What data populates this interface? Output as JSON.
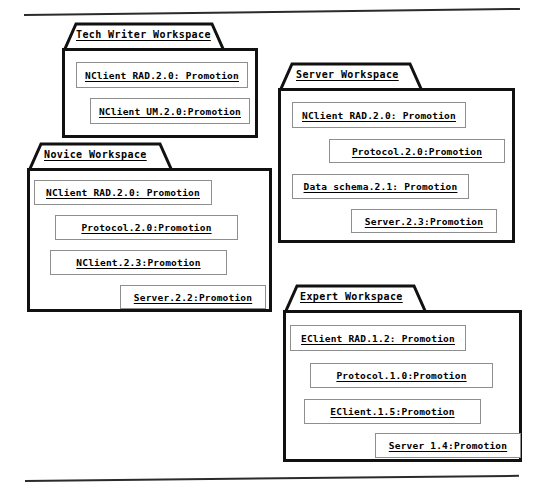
{
  "figure": {
    "background_color": "#ffffff",
    "package_border_color": "#111111",
    "item_border_color": "#8e8e8e",
    "text_color": "#000000",
    "rule_color": "#2b2b2b"
  },
  "rules": [
    {
      "name": "top-rule",
      "x": 24,
      "y": 14,
      "width": 496,
      "angle_deg": -0.7
    },
    {
      "name": "bottom-rule",
      "x": 25,
      "y": 480,
      "width": 494,
      "angle_deg": -0.6
    }
  ],
  "packages": [
    {
      "id": "tech-writer-workspace",
      "title": "Tech Writer Workspace",
      "body": {
        "x": 62,
        "y": 48,
        "width": 196,
        "height": 90
      },
      "tab": {
        "x": 0,
        "y": -26,
        "width": 160,
        "height": 27,
        "slant": 12
      },
      "title_pos": {
        "x": 14,
        "y": -20
      },
      "items": [
        {
          "label": "NClient RAD.2.0: Promotion",
          "x": 11,
          "y": 11,
          "width": 172,
          "height": 26
        },
        {
          "label": "NClient UM.2.0:Promotion",
          "x": 25,
          "y": 47,
          "width": 160,
          "height": 26
        }
      ]
    },
    {
      "id": "server-workspace",
      "title": "Server Workspace",
      "body": {
        "x": 278,
        "y": 88,
        "width": 237,
        "height": 155
      },
      "tab": {
        "x": 0,
        "y": -26,
        "width": 142,
        "height": 27,
        "slant": 12
      },
      "title_pos": {
        "x": 18,
        "y": -20
      },
      "items": [
        {
          "label": "NClient RAD.2.0: Promotion",
          "x": 11,
          "y": 11,
          "width": 174,
          "height": 26
        },
        {
          "label": "Protocol.2.0:Promotion",
          "x": 48,
          "y": 48,
          "width": 176,
          "height": 24
        },
        {
          "label": "Data schema.2.1: Promotion",
          "x": 11,
          "y": 83,
          "width": 177,
          "height": 25
        },
        {
          "label": "Server.2.3:Promotion",
          "x": 70,
          "y": 118,
          "width": 146,
          "height": 24
        }
      ]
    },
    {
      "id": "novice-workspace",
      "title": "Novice Workspace",
      "body": {
        "x": 27,
        "y": 168,
        "width": 245,
        "height": 144
      },
      "tab": {
        "x": 0,
        "y": -26,
        "width": 143,
        "height": 27,
        "slant": 12
      },
      "title_pos": {
        "x": 17,
        "y": -20
      },
      "items": [
        {
          "label": "NClient RAD.2.0: Promotion",
          "x": 4,
          "y": 9,
          "width": 178,
          "height": 25
        },
        {
          "label": "Protocol.2.0:Promotion",
          "x": 25,
          "y": 44,
          "width": 183,
          "height": 25
        },
        {
          "label": "NClient.2.3:Promotion",
          "x": 20,
          "y": 79,
          "width": 177,
          "height": 25
        },
        {
          "label": "Server.2.2:Promotion",
          "x": 90,
          "y": 114,
          "width": 146,
          "height": 24
        }
      ]
    },
    {
      "id": "expert-workspace",
      "title": "Expert Workspace",
      "body": {
        "x": 283,
        "y": 310,
        "width": 239,
        "height": 152
      },
      "tab": {
        "x": 0,
        "y": -26,
        "width": 141,
        "height": 27,
        "slant": 12
      },
      "title_pos": {
        "x": 17,
        "y": -20
      },
      "items": [
        {
          "label": "EClient RAD.1.2: Promotion",
          "x": 4,
          "y": 12,
          "width": 176,
          "height": 26
        },
        {
          "label": "Protocol.1.0:Promotion",
          "x": 24,
          "y": 50,
          "width": 183,
          "height": 25
        },
        {
          "label": "EClient.1.5:Promotion",
          "x": 18,
          "y": 86,
          "width": 177,
          "height": 25
        },
        {
          "label": "Server 1.4:Promotion",
          "x": 89,
          "y": 120,
          "width": 146,
          "height": 25
        }
      ]
    }
  ]
}
